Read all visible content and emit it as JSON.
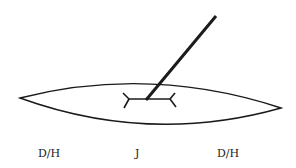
{
  "diagram": {
    "labels": {
      "left": "D/H",
      "center": "J",
      "right": "D/H"
    },
    "colors": {
      "stroke": "#1a1a1a",
      "background": "#ffffff"
    }
  }
}
